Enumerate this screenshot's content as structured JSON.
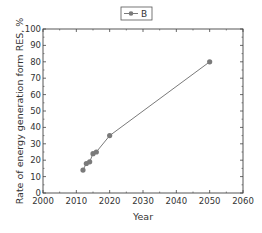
{
  "chart_data": {
    "type": "line",
    "title": "",
    "xlabel": "Year",
    "ylabel": "Rate of energy generation form RES, %",
    "xlim": [
      2000,
      2060
    ],
    "ylim": [
      0,
      100
    ],
    "xticks": [
      2000,
      2010,
      2020,
      2030,
      2040,
      2050,
      2060
    ],
    "yticks": [
      0,
      10,
      20,
      30,
      40,
      50,
      60,
      70,
      80,
      90,
      100
    ],
    "grid": false,
    "legend_position": "top-center",
    "series": [
      {
        "name": "B",
        "color": "#7a7a7a",
        "marker": "circle",
        "x": [
          2012,
          2013,
          2014,
          2015,
          2016,
          2020,
          2050
        ],
        "y": [
          14,
          18,
          19,
          24,
          25,
          35,
          80
        ]
      }
    ]
  },
  "legend": {
    "label": "B"
  }
}
